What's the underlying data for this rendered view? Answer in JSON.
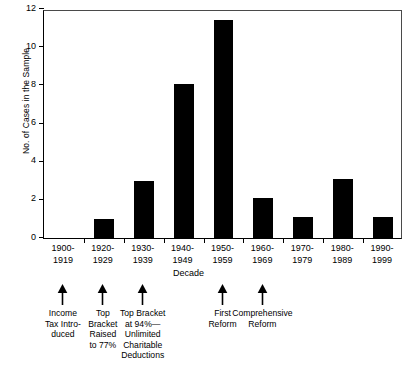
{
  "chart_data": {
    "type": "bar",
    "title": "",
    "xlabel": "Decade",
    "ylabel": "No. of Cases in the Sample",
    "categories": [
      "1900-\n1919",
      "1920-\n1929",
      "1930-\n1939",
      "1940-\n1949",
      "1950-\n1959",
      "1960-\n1969",
      "1970-\n1979",
      "1980-\n1989",
      "1990-\n1999"
    ],
    "values": [
      0,
      1,
      3,
      8.05,
      11.4,
      2.1,
      1.1,
      3.1,
      1.1
    ],
    "ylim": [
      0,
      12
    ],
    "yticks": [
      0,
      2,
      4,
      6,
      8,
      10,
      12
    ],
    "ytick_labels": [
      "0",
      "2",
      "4",
      "6",
      "8",
      "10",
      "12"
    ],
    "grid": false,
    "legend": "none",
    "bar_color": "#000000",
    "annotations": [
      {
        "label": "Income\nTax Intro-\nduced",
        "category": "1900-\n1919"
      },
      {
        "label": "Top\nBracket\nRaised\nto 77%",
        "category": "1920-\n1929"
      },
      {
        "label": "Top Bracket\nat 94%—\nUnlimited\nCharitable\nDeductions",
        "category": "1930-\n1939"
      },
      {
        "label": "First\nReform",
        "category": "1950-\n1959"
      },
      {
        "label": "Comprehensive\nReform",
        "category": "1960-\n1969"
      }
    ]
  },
  "axis": {
    "y_title": "No. of Cases in the Sample",
    "x_title": "Decade",
    "y_labels": [
      "12",
      "10",
      "8",
      "6",
      "4",
      "2",
      "0"
    ],
    "x_labels": [
      "1900-\n1919",
      "1920-\n1929",
      "1930-\n1939",
      "1940-\n1949",
      "1950-\n1959",
      "1960-\n1969",
      "1970-\n1979",
      "1980-\n1989",
      "1990-\n1999"
    ]
  },
  "annotation_labels": [
    "Income\nTax Intro-\nduced",
    "Top\nBracket\nRaised\nto 77%",
    "Top Bracket\nat 94%—\nUnlimited\nCharitable\nDeductions",
    "First\nReform",
    "Comprehensive\nReform"
  ]
}
